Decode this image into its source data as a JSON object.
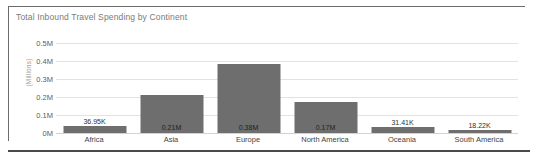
{
  "chart_data": {
    "type": "bar",
    "title": "Total Inbound Travel Spending by Continent",
    "xlabel": "",
    "ylabel": "(Millions)",
    "categories": [
      "Africa",
      "Asia",
      "Europe",
      "North America",
      "Oceania",
      "South America"
    ],
    "values": [
      36950,
      210000,
      385000,
      170000,
      31410,
      18220
    ],
    "data_labels": [
      "36.95K",
      "0.21M",
      "0.38M",
      "0.17M",
      "31.41K",
      "18.22K"
    ],
    "ylim": [
      0,
      500000
    ],
    "yticks": [
      "0M",
      "0.1M",
      "0.2M",
      "0.3M",
      "0.4M",
      "0.5M"
    ],
    "ytick_values": [
      0,
      100000,
      200000,
      300000,
      400000,
      500000
    ],
    "grid": true,
    "legend": "none",
    "series": [
      {
        "name": "Total Inbound Travel Spending",
        "values": [
          36950,
          210000,
          385000,
          170000,
          31410,
          18220
        ]
      }
    ]
  },
  "colors": {
    "bar": "#6e6e6e",
    "gridline": "#e2e2e2",
    "title_text": "#7a7a7a",
    "tick_text": "#5d5d5d",
    "category_text": "#3f3f3f",
    "frame_border": "#6b6b6b",
    "bottom_rule": "#4a4a4a",
    "background": "#ffffff"
  }
}
